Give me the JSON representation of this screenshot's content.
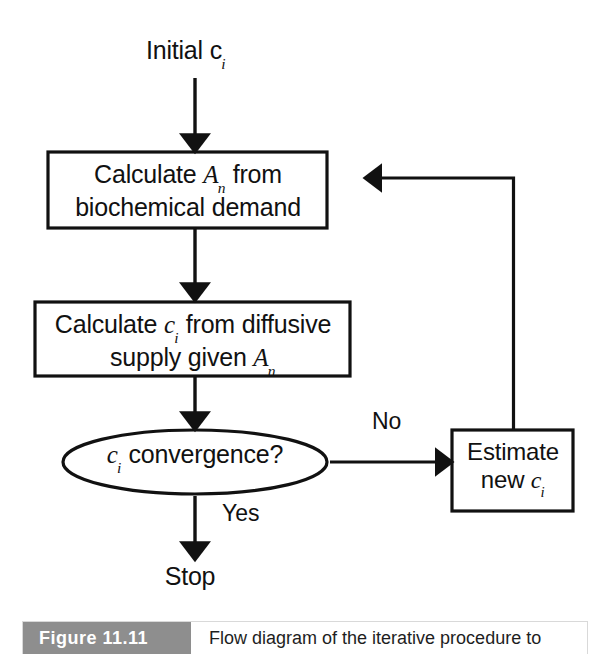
{
  "figure": {
    "badge": "Figure 11.11",
    "caption": "Flow diagram of the iterative procedure to",
    "badge_color": "#8e8e8e",
    "line_color": "#111111",
    "background": "#ffffff"
  },
  "diagram": {
    "type": "flowchart",
    "nodes": [
      {
        "id": "start",
        "shape": "text",
        "text": "Initial c",
        "subscript": "i"
      },
      {
        "id": "calc-an",
        "shape": "rect",
        "line1_pre": "Calculate ",
        "line1_var": "A",
        "line1_sub": "n",
        "line1_post": " from",
        "line2": "biochemical demand"
      },
      {
        "id": "calc-ci",
        "shape": "rect",
        "line1_pre": "Calculate ",
        "line1_var": "c",
        "line1_sub": "i",
        "line1_post": " from diffusive",
        "line2_pre": "supply given ",
        "line2_var": "A",
        "line2_sub": "n"
      },
      {
        "id": "convergence",
        "shape": "ellipse",
        "var": "c",
        "sub": "i",
        "text": " convergence?"
      },
      {
        "id": "estimate",
        "shape": "rect",
        "line1": "Estimate",
        "line2_pre": "new ",
        "line2_var": "c",
        "line2_sub": "i"
      },
      {
        "id": "stop",
        "shape": "text",
        "text": "Stop"
      }
    ],
    "edges": [
      {
        "id": "start-to-calc-an",
        "from": "start",
        "to": "calc-an",
        "label": ""
      },
      {
        "id": "calc-an-to-calc-ci",
        "from": "calc-an",
        "to": "calc-ci",
        "label": ""
      },
      {
        "id": "calc-ci-to-convergence",
        "from": "calc-ci",
        "to": "convergence",
        "label": ""
      },
      {
        "id": "convergence-to-estimate",
        "from": "convergence",
        "to": "estimate",
        "label": "No"
      },
      {
        "id": "convergence-to-stop",
        "from": "convergence",
        "to": "stop",
        "label": "Yes"
      },
      {
        "id": "estimate-to-calc-an",
        "from": "estimate",
        "to": "calc-an",
        "label": ""
      }
    ]
  }
}
